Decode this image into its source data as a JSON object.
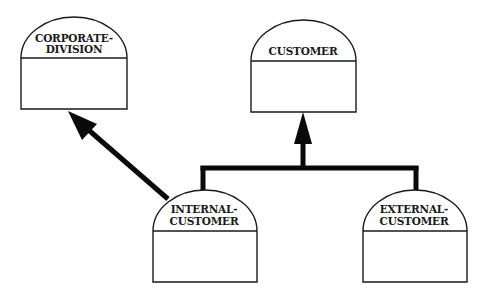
{
  "diagram": {
    "type": "entity-generalization",
    "colors": {
      "stroke": "#1a1a1a",
      "connector": "#0a0a0a",
      "background": "#ffffff"
    },
    "entities": [
      {
        "id": "corporate-division",
        "label_lines": [
          "CORPORATE-",
          "DIVISION"
        ],
        "x": 21,
        "y_top": 17,
        "y_divider": 58,
        "y_bottom": 109,
        "width": 106
      },
      {
        "id": "customer",
        "label_lines": [
          "CUSTOMER"
        ],
        "x": 251,
        "y_top": 20,
        "y_divider": 61,
        "y_bottom": 112,
        "width": 105
      },
      {
        "id": "internal-customer",
        "label_lines": [
          "INTERNAL-",
          "CUSTOMER"
        ],
        "x": 153,
        "y_top": 190,
        "y_divider": 231,
        "y_bottom": 282,
        "width": 104
      },
      {
        "id": "external-customer",
        "label_lines": [
          "EXTERNAL-",
          "CUSTOMER"
        ],
        "x": 363,
        "y_top": 190,
        "y_divider": 231,
        "y_bottom": 282,
        "width": 104
      }
    ],
    "relationships": [
      {
        "from": "internal-customer",
        "to": "corporate-division",
        "kind": "arrow"
      },
      {
        "from": [
          "internal-customer",
          "external-customer"
        ],
        "to": "customer",
        "kind": "generalization-arrow"
      }
    ]
  }
}
